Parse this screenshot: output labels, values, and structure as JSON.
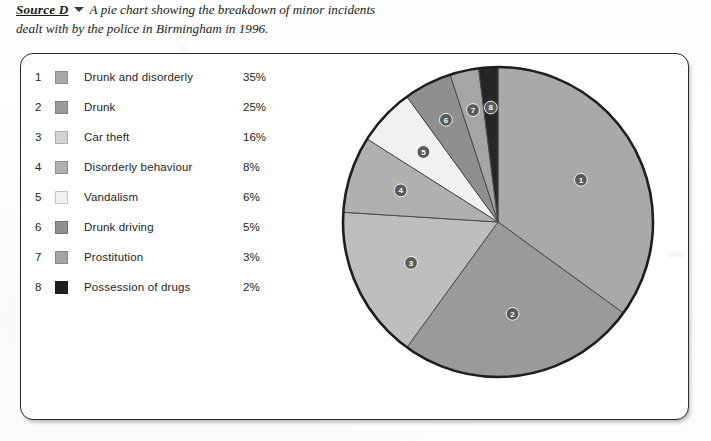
{
  "caption": {
    "source_label": "Source D",
    "marker_icon": "triangle-down-icon",
    "text": "A pie chart showing the breakdown of minor incidents dealt with by the police in Birmingham in 1996."
  },
  "cut_off_axis_labels": [
    {
      "lines": [
        "En",
        "and"
      ]
    },
    {
      "lines": [
        "Sco"
      ]
    },
    {
      "lines": [
        "Nor",
        "Ir"
      ]
    },
    {
      "lines": [
        "Fr"
      ]
    },
    {
      "lines": [
        "Switze"
      ]
    },
    {
      "lines": [
        "Euro",
        "ave"
      ]
    }
  ],
  "chart_data": {
    "type": "pie",
    "title": "A pie chart showing the breakdown of minor incidents dealt with by the police in Birmingham in 1996.",
    "xlabel": "",
    "ylabel": "",
    "legend_position": "left",
    "grid": false,
    "units": "%",
    "start_angle_deg": 0,
    "direction": "clockwise",
    "categories": [
      "Drunk and disorderly",
      "Drunk",
      "Car theft",
      "Disorderly behaviour",
      "Vandalism",
      "Drunk driving",
      "Prostitution",
      "Possession of drugs"
    ],
    "values": [
      35,
      25,
      16,
      8,
      6,
      5,
      3,
      2
    ],
    "value_labels": [
      "35%",
      "25%",
      "16%",
      "8%",
      "6%",
      "5%",
      "3%",
      "2%"
    ],
    "slice_numbers": [
      "1",
      "2",
      "3",
      "4",
      "5",
      "6",
      "7",
      "8"
    ],
    "colors": [
      "#a9a9a9",
      "#9a9a9a",
      "#bebebe",
      "#b0b0b0",
      "#f1f1f1",
      "#8f8f8f",
      "#a5a5a5",
      "#262626"
    ]
  },
  "legend": {
    "rows": [
      {
        "num": "1",
        "name": "Drunk and disorderly",
        "pct": "35%",
        "color": "#a9a9a9"
      },
      {
        "num": "2",
        "name": "Drunk",
        "pct": "25%",
        "color": "#9a9a9a"
      },
      {
        "num": "3",
        "name": "Car theft",
        "pct": "16%",
        "color": "#d2d2d2"
      },
      {
        "num": "4",
        "name": "Disorderly behaviour",
        "pct": "8%",
        "color": "#b0b0b0"
      },
      {
        "num": "5",
        "name": "Vandalism",
        "pct": "6%",
        "color": "#f1f1f1"
      },
      {
        "num": "6",
        "name": "Drunk driving",
        "pct": "5%",
        "color": "#8f8f8f"
      },
      {
        "num": "7",
        "name": "Prostitution",
        "pct": "3%",
        "color": "#a5a5a5"
      },
      {
        "num": "8",
        "name": "Possession of drugs",
        "pct": "2%",
        "color": "#1f1f1f"
      }
    ]
  },
  "colors": {
    "frame_stroke": "#2b2b2b",
    "pie_rim": "#1e1e1e",
    "slice_edge": "#4a4a4a",
    "badge_fill": "#5a5a5a",
    "text": "#242424",
    "page_bg": "#ffffff"
  }
}
